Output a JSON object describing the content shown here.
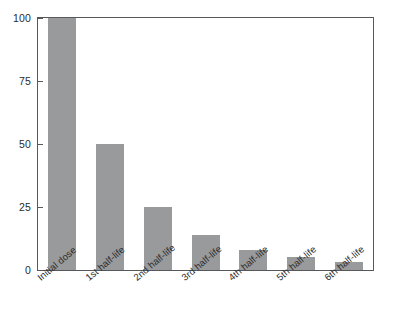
{
  "chart_data": {
    "type": "bar",
    "title": "",
    "subtitle": "",
    "xlabel": "",
    "ylabel": "",
    "categories": [
      "Initial dose",
      "1st half-life",
      "2nd half-life",
      "3rd half-life",
      "4th half-life",
      "5th half-life",
      "6th half-life"
    ],
    "values": [
      100,
      50,
      25,
      14,
      8,
      5,
      3
    ],
    "ylim": [
      0,
      100
    ],
    "yticks": [
      0,
      25,
      50,
      75,
      100
    ],
    "ytick_labels": [
      "0",
      "25",
      "50",
      "75",
      "100"
    ],
    "grid": false,
    "legend": null,
    "legend_position": "none",
    "annotations": [],
    "bar_color": "#999a9c",
    "axis_color": "#58585a",
    "text_color": "#2b2b2b",
    "background_color": "#ffffff",
    "x_label_rotation_deg": -40
  }
}
